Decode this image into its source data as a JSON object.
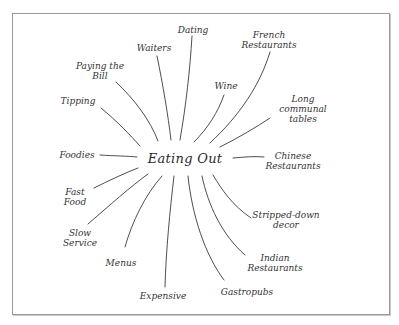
{
  "diagram": {
    "type": "mind-map",
    "center": {
      "label": "Eating Out"
    },
    "branches": [
      {
        "id": "dating",
        "label": "Dating"
      },
      {
        "id": "french-restaurants",
        "label": "French\nRestaurants"
      },
      {
        "id": "waiters",
        "label": "Waiters"
      },
      {
        "id": "paying-the-bill",
        "label": "Paying the\nBill"
      },
      {
        "id": "wine",
        "label": "Wine"
      },
      {
        "id": "long-communal-tables",
        "label": "Long\ncommunal\ntables"
      },
      {
        "id": "tipping",
        "label": "Tipping"
      },
      {
        "id": "foodies",
        "label": "Foodies"
      },
      {
        "id": "chinese-restaurants",
        "label": "Chinese\nRestaurants"
      },
      {
        "id": "fast-food",
        "label": "Fast\nFood"
      },
      {
        "id": "slow-service",
        "label": "Slow\nService"
      },
      {
        "id": "stripped-down-decor",
        "label": "Stripped-down\ndecor"
      },
      {
        "id": "menus",
        "label": "Menus"
      },
      {
        "id": "indian-restaurants",
        "label": "Indian\nRestaurants"
      },
      {
        "id": "expensive",
        "label": "Expensive"
      },
      {
        "id": "gastropubs",
        "label": "Gastropubs"
      }
    ],
    "lines": {
      "dating": [
        "Dating"
      ],
      "french": [
        "French",
        "Restaurants"
      ],
      "waiters": [
        "Waiters"
      ],
      "paying": [
        "Paying the",
        "Bill"
      ],
      "wine": [
        "Wine"
      ],
      "long": [
        "Long",
        "communal",
        "tables"
      ],
      "tipping": [
        "Tipping"
      ],
      "foodies": [
        "Foodies"
      ],
      "chinese": [
        "Chinese",
        "Restaurants"
      ],
      "fastfood": [
        "Fast",
        "Food"
      ],
      "slow": [
        "Slow",
        "Service"
      ],
      "stripped": [
        "Stripped-down",
        "decor"
      ],
      "menus": [
        "Menus"
      ],
      "indian": [
        "Indian",
        "Restaurants"
      ],
      "expensive": [
        "Expensive"
      ],
      "gastropubs": [
        "Gastropubs"
      ]
    }
  }
}
